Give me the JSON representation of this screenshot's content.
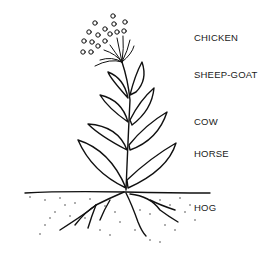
{
  "diagram": {
    "type": "plant-illustration",
    "labels": [
      {
        "text": "CHICKEN",
        "part": "flower-head"
      },
      {
        "text": "SHEEP-GOAT",
        "part": "upper-leaves"
      },
      {
        "text": "COW",
        "part": "middle-leaves"
      },
      {
        "text": "HORSE",
        "part": "lower-leaves"
      },
      {
        "text": "HOG",
        "part": "roots"
      }
    ]
  }
}
